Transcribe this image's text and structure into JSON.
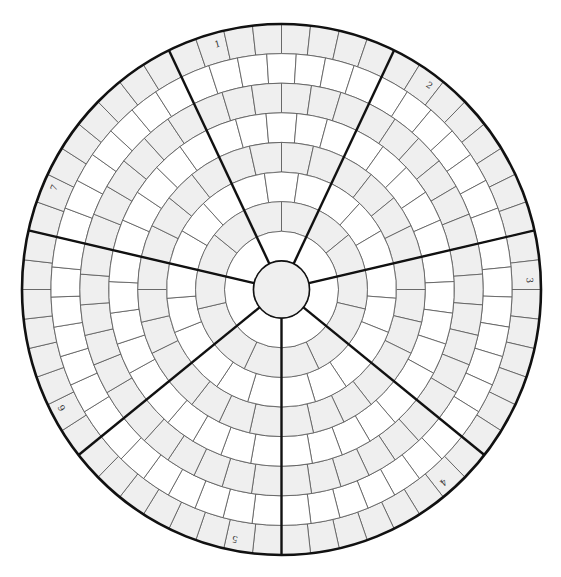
{
  "diagram": {
    "title": "",
    "center": {
      "x": 281.5,
      "y": 289.5
    },
    "radius_x": 259.5,
    "radius_y": 265.5,
    "center_circle_ratio": 0.108,
    "sector_count": 7,
    "sector_labels": [
      "1",
      "2",
      "3",
      "4",
      "5",
      "6",
      "7"
    ],
    "rings": [
      {
        "index": 1,
        "cells_per_sector": 8,
        "fill": "#efefef"
      },
      {
        "index": 2,
        "cells_per_sector": 7,
        "fill": "#ffffff"
      },
      {
        "index": 3,
        "cells_per_sector": 6,
        "fill": "#efefef"
      },
      {
        "index": 4,
        "cells_per_sector": 5,
        "fill": "#ffffff"
      },
      {
        "index": 5,
        "cells_per_sector": 4,
        "fill": "#efefef"
      },
      {
        "index": 6,
        "cells_per_sector": 3,
        "fill": "#ffffff"
      },
      {
        "index": 7,
        "cells_per_sector": 2,
        "fill": "#efefef"
      },
      {
        "index": 8,
        "cells_per_sector": 1,
        "fill": "#ffffff"
      }
    ],
    "center_fill": "#efefef",
    "colors": {
      "thin_line": "#555555",
      "thick_line": "#111111",
      "gray_cell": "#efefef",
      "white_cell": "#ffffff"
    }
  }
}
